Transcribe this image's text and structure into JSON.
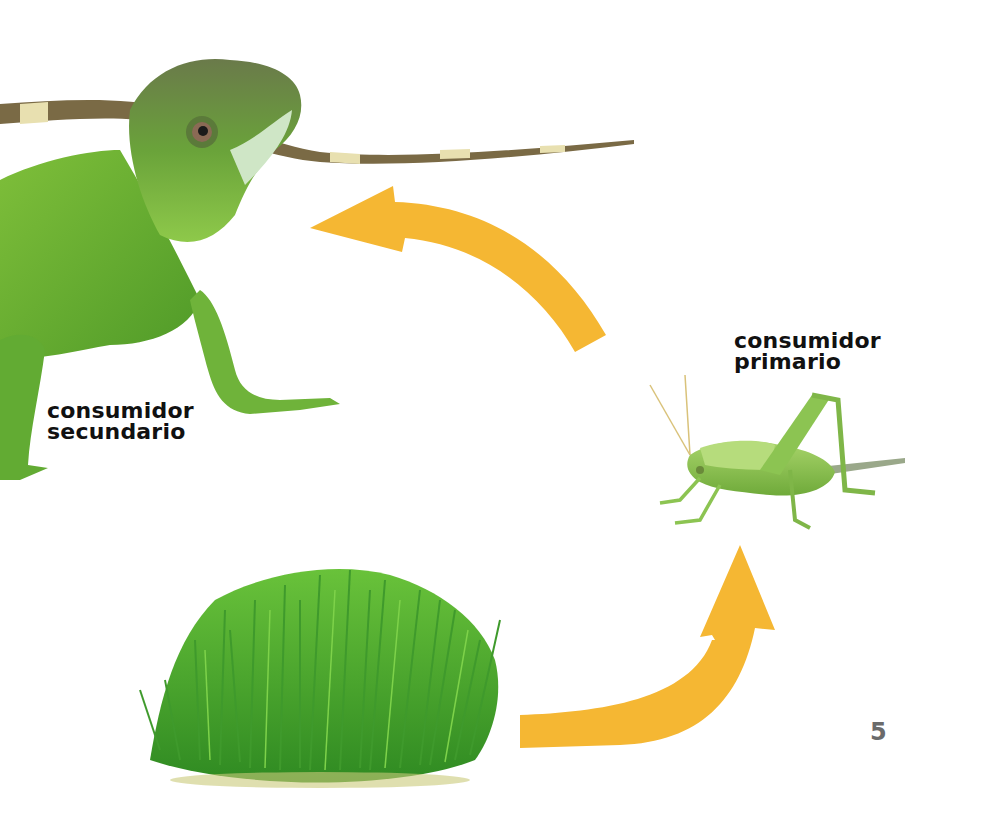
{
  "page": {
    "number": "5",
    "background_color": "#ffffff"
  },
  "food_chain": {
    "arrow_color": "#F5B733",
    "organisms": [
      {
        "id": "producer",
        "image": "grass-clump-photo",
        "label_lines": []
      },
      {
        "id": "primary",
        "image": "green-grasshopper-photo",
        "label_lines": [
          "consumidor",
          "primario"
        ]
      },
      {
        "id": "secondary",
        "image": "green-lizard-photo",
        "label_lines": [
          "consumidor",
          "secundario"
        ]
      }
    ],
    "arrows": [
      {
        "from": "producer",
        "to": "primary"
      },
      {
        "from": "primary",
        "to": "secondary"
      }
    ]
  }
}
